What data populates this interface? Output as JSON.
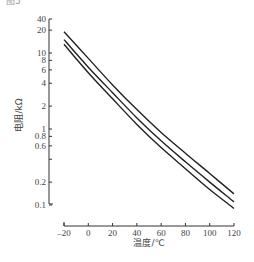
{
  "figure": {
    "top_fragment": "图5"
  },
  "chart_data": {
    "type": "line",
    "title": "",
    "xlabel": "温度/℃",
    "ylabel": "电阻/kΩ",
    "x_ticks": [
      -20,
      0,
      20,
      40,
      60,
      80,
      100,
      120
    ],
    "x_tick_labels": [
      "–20",
      "0",
      "20",
      "40",
      "60",
      "80",
      "100",
      "120"
    ],
    "y_ticks": [
      40,
      20,
      10,
      8,
      6,
      4,
      2,
      1,
      0.8,
      0.6,
      0.4,
      0.2,
      0.1
    ],
    "y_tick_labels": [
      "40",
      "20",
      "10",
      "8",
      "6",
      "4",
      "2",
      "1",
      "0.8",
      "0.6",
      "",
      "0.2",
      "0.1"
    ],
    "y_scale": "log",
    "xlim": [
      -20,
      120
    ],
    "ylim": [
      0.1,
      40
    ],
    "grid": false,
    "legend": null,
    "x": [
      -20,
      0,
      20,
      40,
      60,
      80,
      100,
      120
    ],
    "series": [
      {
        "name": "upper",
        "values": [
          19,
          8.5,
          3.8,
          1.8,
          0.9,
          0.48,
          0.26,
          0.14
        ]
      },
      {
        "name": "middle",
        "values": [
          15,
          6.5,
          3.0,
          1.4,
          0.7,
          0.37,
          0.2,
          0.11
        ]
      },
      {
        "name": "lower",
        "values": [
          13,
          5.5,
          2.5,
          1.15,
          0.57,
          0.3,
          0.16,
          0.09
        ]
      }
    ],
    "line_color": "#222222"
  }
}
